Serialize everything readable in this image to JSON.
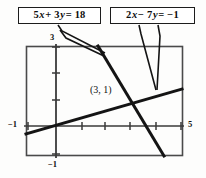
{
  "figure": {
    "background_color": "#fdfdfc",
    "ink_color": "#141414"
  },
  "callouts": [
    {
      "id": "equation-1",
      "text": "5x + 3y = 18",
      "lhs_coef_x": 5,
      "lhs_coef_y": 3,
      "rhs": 18
    },
    {
      "id": "equation-2",
      "text": "2x − 7y = −1",
      "lhs_coef_x": 2,
      "lhs_coef_y": -7,
      "rhs": -1
    }
  ],
  "axes": {
    "y_top_label": "3",
    "y_bottom_label": "−1",
    "x_left_label": "−1",
    "x_right_label": "5"
  },
  "point": {
    "label": "(3, 1)",
    "x": 3,
    "y": 1
  },
  "chart_data": {
    "type": "line",
    "title": "",
    "xlabel": "",
    "ylabel": "",
    "xlim": [
      -1,
      5
    ],
    "ylim": [
      -1,
      3
    ],
    "grid": false,
    "legend": "callout-boxes",
    "xticks": [
      -1,
      0,
      1,
      2,
      3,
      4,
      5
    ],
    "yticks": [
      -1,
      0,
      1,
      2,
      3
    ],
    "series": [
      {
        "name": "5x + 3y = 18",
        "equation": "5x + 3y = 18",
        "slope": -1.6667,
        "intercept": 6,
        "points": [
          [
            1.8,
            3
          ],
          [
            3,
            1
          ],
          [
            4.2,
            -1
          ]
        ]
      },
      {
        "name": "2x − 7y = −1",
        "equation": "2x − 7y = −1",
        "slope": 0.2857,
        "intercept": 0.1429,
        "points": [
          [
            -1,
            -0.143
          ],
          [
            3,
            1
          ],
          [
            5,
            1.571
          ]
        ]
      }
    ],
    "annotations": [
      {
        "text": "(3, 1)",
        "x": 3,
        "y": 1,
        "kind": "intersection-point"
      }
    ]
  }
}
